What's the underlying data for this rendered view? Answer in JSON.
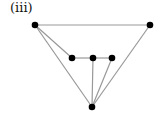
{
  "label": "(iii)",
  "graph": {
    "edge_color": "#999999",
    "node_color": "#000000",
    "node_radius": 3.3,
    "nodes": [
      {
        "id": "top-left",
        "x": 35,
        "y": 25
      },
      {
        "id": "top-right",
        "x": 150,
        "y": 25
      },
      {
        "id": "mid-left",
        "x": 72,
        "y": 58
      },
      {
        "id": "mid-center",
        "x": 93,
        "y": 58
      },
      {
        "id": "mid-right",
        "x": 112,
        "y": 58
      },
      {
        "id": "bottom",
        "x": 92,
        "y": 107
      }
    ],
    "edges": [
      [
        "top-left",
        "top-right"
      ],
      [
        "top-left",
        "mid-left"
      ],
      [
        "top-left",
        "bottom"
      ],
      [
        "top-right",
        "bottom"
      ],
      [
        "mid-left",
        "mid-center"
      ],
      [
        "mid-center",
        "mid-right"
      ],
      [
        "mid-center",
        "bottom"
      ],
      [
        "mid-right",
        "bottom"
      ]
    ]
  }
}
